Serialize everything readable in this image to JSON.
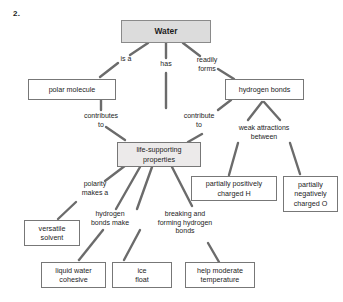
{
  "page": {
    "item_number": "2.",
    "background_color": "#ffffff",
    "node_border_color": "#777777",
    "root_fill_color": "#dcdcdc",
    "shaded_fill_color": "#eceaea",
    "connector_color": "#6b6b6b",
    "text_color": "#1d1d1d"
  },
  "diagram": {
    "type": "concept-map",
    "nodes": [
      {
        "id": "water",
        "label": "Water",
        "style": "root"
      },
      {
        "id": "polar-molecule",
        "label": "polar molecule",
        "style": "plain"
      },
      {
        "id": "hydrogen-bonds",
        "label": "hydrogen bonds",
        "style": "plain"
      },
      {
        "id": "life-supporting-properties",
        "label": "life-supporting properties",
        "style": "shaded"
      },
      {
        "id": "partially-positively-charged-h",
        "label": "partially positively charged H",
        "style": "plain"
      },
      {
        "id": "partially-negatively-charged-o",
        "label": "partially negatively charged O",
        "style": "plain"
      },
      {
        "id": "versatile-solvent",
        "label": "versatile solvent",
        "style": "plain"
      },
      {
        "id": "liquid-water-cohesive",
        "label": "liquid water cohesive",
        "style": "plain"
      },
      {
        "id": "ice-float",
        "label": "ice float",
        "style": "plain"
      },
      {
        "id": "help-moderate-temperature",
        "label": "help moderate temperature",
        "style": "plain"
      }
    ],
    "edges": [
      {
        "id": "water-to-polar-molecule",
        "from": "water",
        "to": "polar-molecule",
        "label": "is a"
      },
      {
        "id": "water-to-life-supporting",
        "from": "water",
        "to": "life-supporting-properties",
        "label": "has"
      },
      {
        "id": "water-to-hydrogen-bonds",
        "from": "water",
        "to": "hydrogen-bonds",
        "label": "readily forms"
      },
      {
        "id": "polar-molecule-to-life-supporting",
        "from": "polar-molecule",
        "to": "life-supporting-properties",
        "label": "contributes to"
      },
      {
        "id": "hydrogen-bonds-to-life-supporting",
        "from": "hydrogen-bonds",
        "to": "life-supporting-properties",
        "label": "contribute to"
      },
      {
        "id": "hydrogen-bonds-to-charges",
        "from": "hydrogen-bonds",
        "to": "partially-positively-charged-h",
        "label": "weak attractions between"
      },
      {
        "id": "life-supporting-to-versatile-solvent",
        "from": "life-supporting-properties",
        "to": "versatile-solvent",
        "label": "polarity makes a"
      },
      {
        "id": "life-supporting-to-cohesive-and-ice",
        "from": "life-supporting-properties",
        "to": "liquid-water-cohesive",
        "label": "hydrogen bonds make"
      },
      {
        "id": "life-supporting-to-temperature",
        "from": "life-supporting-properties",
        "to": "help-moderate-temperature",
        "label": "breaking and forming hydrogen bonds"
      }
    ],
    "edge_labels": {
      "is_a": "is a",
      "has": "has",
      "readily_forms": "readily\nforms",
      "contributes_to": "contributes\nto",
      "contribute_to": "contribute\nto",
      "weak_attractions_between": "weak attractions\nbetween",
      "polarity_makes_a": "polarity\nmakes a",
      "hydrogen_bonds_make": "hydrogen\nbonds make",
      "breaking_and_forming": "breaking and\nforming hydrogen\nbonds"
    },
    "node_labels": {
      "water": "Water",
      "polar_molecule": "polar molecule",
      "hydrogen_bonds": "hydrogen bonds",
      "life_supporting_properties": "life-supporting\nproperties",
      "partially_positively_charged_h": "partially positively\ncharged H",
      "partially_negatively_charged_o": "partially\nnegatively\ncharged O",
      "versatile_solvent": "versatile\nsolvent",
      "liquid_water_cohesive": "liquid water\ncohesive",
      "ice_float": "ice\nfloat",
      "help_moderate_temperature": "help moderate\ntemperature"
    }
  }
}
